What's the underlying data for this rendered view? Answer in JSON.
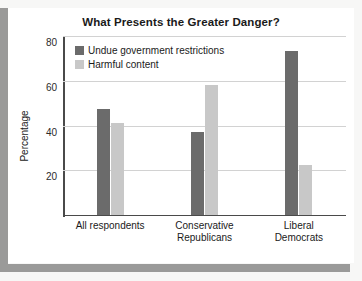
{
  "chart_data": {
    "type": "bar",
    "title": "What Presents the Greater Danger?",
    "xlabel": "",
    "ylabel": "Percentage",
    "categories": [
      "All respondents",
      "Conservative\nRepublicans",
      "Liberal\nDemocrats"
    ],
    "series": [
      {
        "name": "Undue government restrictions",
        "color": "#6b6b6b",
        "values": [
          47,
          37,
          73
        ]
      },
      {
        "name": "Harmful content",
        "color": "#c8c8c8",
        "values": [
          41,
          58,
          22
        ]
      }
    ],
    "ylim": [
      0,
      80
    ],
    "yticks": [
      20,
      40,
      60,
      80
    ],
    "ytick_labels": [
      "20",
      "40",
      "60",
      "80"
    ],
    "grid": true,
    "legend_position": "top-left-inside"
  },
  "colors": {
    "series_dark": "#6b6b6b",
    "series_light": "#c8c8c8",
    "axis": "#4a4a4a",
    "gridline": "#d2d2d2",
    "frame": "#9a9a99",
    "panel": "#ffffff",
    "text": "#1a1a1a"
  }
}
